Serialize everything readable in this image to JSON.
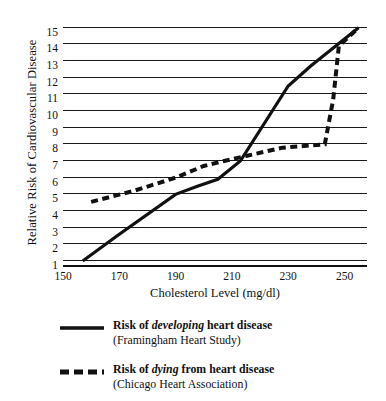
{
  "chart_data": {
    "type": "line",
    "title": "",
    "xlabel": "Cholesterol Level (mg/dl)",
    "ylabel": "Relative Risk of Cardiovascular Disease",
    "xlim": [
      150,
      258
    ],
    "ylim": [
      1,
      15.4
    ],
    "xticks": [
      150,
      170,
      190,
      210,
      230,
      250
    ],
    "yticks": [
      1,
      2,
      3,
      4,
      5,
      6,
      7,
      8,
      9,
      10,
      11,
      12,
      13,
      14,
      15
    ],
    "grid": true,
    "legend_position": "below-plot",
    "series": [
      {
        "name": "Risk of developing heart disease",
        "source": "(Framingham Heart Study)",
        "style": "solid",
        "color": "#111111",
        "points": [
          [
            157,
            1.3
          ],
          [
            170,
            2.9
          ],
          [
            190,
            5.3
          ],
          [
            198,
            5.8
          ],
          [
            205,
            6.2
          ],
          [
            213,
            7.3
          ],
          [
            230,
            11.8
          ],
          [
            238,
            13.0
          ],
          [
            255,
            15.3
          ]
        ]
      },
      {
        "name": "Risk of dying from heart disease",
        "source": "(Chicago Heart Association)",
        "style": "dashed",
        "color": "#111111",
        "points": [
          [
            160,
            4.85
          ],
          [
            175,
            5.5
          ],
          [
            190,
            6.3
          ],
          [
            200,
            7.0
          ],
          [
            206,
            7.25
          ],
          [
            215,
            7.6
          ],
          [
            228,
            8.1
          ],
          [
            243,
            8.3
          ],
          [
            246,
            11.0
          ],
          [
            248,
            14.2
          ],
          [
            255,
            15.3
          ]
        ]
      }
    ]
  },
  "legend": {
    "items": [
      {
        "prefix": "Risk of ",
        "emphasis": "developing",
        "suffix": " heart disease",
        "source": "(Framingham Heart Study)",
        "style": "solid"
      },
      {
        "prefix": "Risk of ",
        "emphasis": "dying",
        "suffix": " from heart disease",
        "source": "(Chicago Heart Association)",
        "style": "dashed"
      }
    ]
  }
}
